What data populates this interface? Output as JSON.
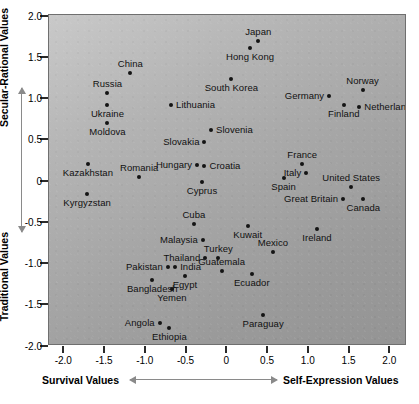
{
  "chart_data": {
    "type": "scatter",
    "title": "",
    "xlabel_left": "Survival Values",
    "xlabel_right": "Self-Expression Values",
    "ylabel_top": "Secular-Rational Values",
    "ylabel_bottom": "Traditional Values",
    "xlim": [
      -2.3,
      2.3
    ],
    "ylim": [
      -2.15,
      2.0
    ],
    "xticks": [
      "-2.0",
      "-1.5",
      "-1.0",
      "-0.5",
      "0",
      "0.5",
      "1.0",
      "1.5",
      "2.0"
    ],
    "xtick_values": [
      -2.0,
      -1.5,
      -1.0,
      -0.5,
      0,
      0.5,
      1.0,
      1.5,
      2.0
    ],
    "yticks": [
      "2.0",
      "1.5",
      "1.0",
      "0.5",
      "0",
      "-0.5",
      "-1.0",
      "-1.5",
      "-2.0"
    ],
    "ytick_values": [
      2.0,
      1.5,
      1.0,
      0.5,
      0,
      -0.5,
      -1.0,
      -1.5,
      -2.0
    ],
    "grid": false,
    "legend": "none",
    "marker_color": "#141414",
    "plot_background": "#b0b0b0",
    "points": [
      {
        "label": "Japan",
        "x": 0.38,
        "y": 1.7,
        "pos": "a"
      },
      {
        "label": "Hong Kong",
        "x": 0.28,
        "y": 1.62,
        "pos": "b"
      },
      {
        "label": "China",
        "x": -1.19,
        "y": 1.31,
        "pos": "a"
      },
      {
        "label": "Norway",
        "x": 1.66,
        "y": 1.11,
        "pos": "a"
      },
      {
        "label": "Russia",
        "x": -1.47,
        "y": 1.07,
        "pos": "a"
      },
      {
        "label": "South Korea",
        "x": 0.05,
        "y": 1.24,
        "pos": "b"
      },
      {
        "label": "Netherlands",
        "x": 1.62,
        "y": 0.9,
        "pos": "l"
      },
      {
        "label": "Germany",
        "x": 1.25,
        "y": 1.04,
        "pos": "r"
      },
      {
        "label": "Ukraine",
        "x": -1.47,
        "y": 0.93,
        "pos": "b"
      },
      {
        "label": "Lithuania",
        "x": -0.69,
        "y": 0.93,
        "pos": "l"
      },
      {
        "label": "Finland",
        "x": 1.43,
        "y": 0.93,
        "pos": "b"
      },
      {
        "label": "Moldova",
        "x": -1.47,
        "y": 0.71,
        "pos": "b"
      },
      {
        "label": "Slovenia",
        "x": -0.2,
        "y": 0.62,
        "pos": "l"
      },
      {
        "label": "Slovakia",
        "x": -0.28,
        "y": 0.48,
        "pos": "r"
      },
      {
        "label": "Hungary",
        "x": -0.37,
        "y": 0.2,
        "pos": "r"
      },
      {
        "label": "Croatia",
        "x": -0.28,
        "y": 0.19,
        "pos": "l"
      },
      {
        "label": "France",
        "x": 0.92,
        "y": 0.21,
        "pos": "a"
      },
      {
        "label": "Italy",
        "x": 0.97,
        "y": 0.1,
        "pos": "r"
      },
      {
        "label": "Kazakhstan",
        "x": -1.71,
        "y": 0.21,
        "pos": "b"
      },
      {
        "label": "Romania",
        "x": -1.08,
        "y": 0.06,
        "pos": "a"
      },
      {
        "label": "Cyprus",
        "x": -0.31,
        "y": 0.0,
        "pos": "b"
      },
      {
        "label": "Spain",
        "x": 0.69,
        "y": 0.04,
        "pos": "b"
      },
      {
        "label": "United States",
        "x": 1.52,
        "y": -0.07,
        "pos": "a"
      },
      {
        "label": "Great Britain",
        "x": 1.42,
        "y": -0.21,
        "pos": "r"
      },
      {
        "label": "Canada",
        "x": 1.67,
        "y": -0.21,
        "pos": "b"
      },
      {
        "label": "Kyrgyzstan",
        "x": -1.72,
        "y": -0.15,
        "pos": "b"
      },
      {
        "label": "Cuba",
        "x": -0.41,
        "y": -0.52,
        "pos": "a"
      },
      {
        "label": "Kuwait",
        "x": 0.25,
        "y": -0.54,
        "pos": "b"
      },
      {
        "label": "Ireland",
        "x": 1.1,
        "y": -0.58,
        "pos": "b"
      },
      {
        "label": "Malaysia",
        "x": -0.3,
        "y": -0.71,
        "pos": "r"
      },
      {
        "label": "Mexico",
        "x": 0.56,
        "y": -0.86,
        "pos": "a"
      },
      {
        "label": "Turkey",
        "x": -0.11,
        "y": -0.93,
        "pos": "a"
      },
      {
        "label": "Thailand",
        "x": -0.27,
        "y": -0.93,
        "pos": "r"
      },
      {
        "label": "Pakistan",
        "x": -0.73,
        "y": -1.04,
        "pos": "r"
      },
      {
        "label": "India",
        "x": -0.64,
        "y": -1.04,
        "pos": "l"
      },
      {
        "label": "Guatemala",
        "x": -0.07,
        "y": -1.08,
        "pos": "a"
      },
      {
        "label": "Ecuador",
        "x": 0.3,
        "y": -1.12,
        "pos": "b"
      },
      {
        "label": "Bangladesh",
        "x": -0.92,
        "y": -1.19,
        "pos": "b"
      },
      {
        "label": "Egypt",
        "x": -0.52,
        "y": -1.15,
        "pos": "b"
      },
      {
        "label": "Yemen",
        "x": -0.68,
        "y": -1.3,
        "pos": "b"
      },
      {
        "label": "Paraguay",
        "x": 0.44,
        "y": -1.62,
        "pos": "b"
      },
      {
        "label": "Angola",
        "x": -0.83,
        "y": -1.72,
        "pos": "r"
      },
      {
        "label": "Ethiopia",
        "x": -0.71,
        "y": -1.78,
        "pos": "b"
      }
    ]
  }
}
